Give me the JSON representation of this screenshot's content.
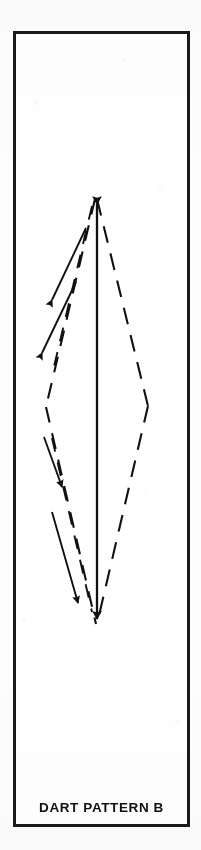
{
  "figure": {
    "caption": "DART PATTERN B",
    "frame": {
      "x": 13,
      "y": 31,
      "width": 177,
      "height": 796,
      "stroke_color": "#1a1a1a",
      "stroke_width": 3,
      "fill_color": "#ffffff"
    },
    "background_color": "#fdfdfd",
    "ink_color": "#111111",
    "diagram_type": "dart-pattern",
    "geometry": {
      "apex_top": {
        "x": 97,
        "y": 195
      },
      "apex_bottom": {
        "x": 97,
        "y": 628
      },
      "vertex_left": {
        "x": 46,
        "y": 407
      },
      "vertex_right": {
        "x": 148,
        "y": 406
      },
      "center_line_x": 97
    },
    "elements": [
      {
        "name": "center-fold-line",
        "style": "solid",
        "arrowheads": "both-ends",
        "from": {
          "x": 97,
          "y": 195
        },
        "to": {
          "x": 97,
          "y": 628
        }
      },
      {
        "name": "stitch-line-upper-right",
        "style": "dashed",
        "arrowheads": "none",
        "from": {
          "x": 97,
          "y": 195
        },
        "to": {
          "x": 148,
          "y": 406
        }
      },
      {
        "name": "stitch-line-lower-right",
        "style": "dashed",
        "arrowheads": "none",
        "from": {
          "x": 148,
          "y": 406
        },
        "to": {
          "x": 97,
          "y": 628
        }
      },
      {
        "name": "stitch-line-upper-left",
        "style": "dashed",
        "arrowheads": "none",
        "from": {
          "x": 97,
          "y": 195
        },
        "to": {
          "x": 46,
          "y": 407
        }
      },
      {
        "name": "stitch-line-lower-left",
        "style": "dashed",
        "arrowheads": "none",
        "from": {
          "x": 46,
          "y": 407
        },
        "to": {
          "x": 97,
          "y": 628
        }
      },
      {
        "name": "direction-arrow-upper-left-inner",
        "style": "solid",
        "arrowheads": "start",
        "from": {
          "x": 52,
          "y": 300
        },
        "to": {
          "x": 86,
          "y": 226
        }
      },
      {
        "name": "direction-arrow-upper-left-outer",
        "style": "solid",
        "arrowheads": "start",
        "from": {
          "x": 43,
          "y": 352
        },
        "to": {
          "x": 76,
          "y": 281
        }
      },
      {
        "name": "direction-arrow-lower-left-inner",
        "style": "solid",
        "arrowheads": "end",
        "from": {
          "x": 47,
          "y": 448
        },
        "to": {
          "x": 62,
          "y": 487
        }
      },
      {
        "name": "direction-arrow-lower-left-outer",
        "style": "solid",
        "arrowheads": "end",
        "from": {
          "x": 53,
          "y": 512
        },
        "to": {
          "x": 78,
          "y": 605
        }
      }
    ]
  },
  "caption_bar": {
    "label": "DART PATTERN B"
  }
}
